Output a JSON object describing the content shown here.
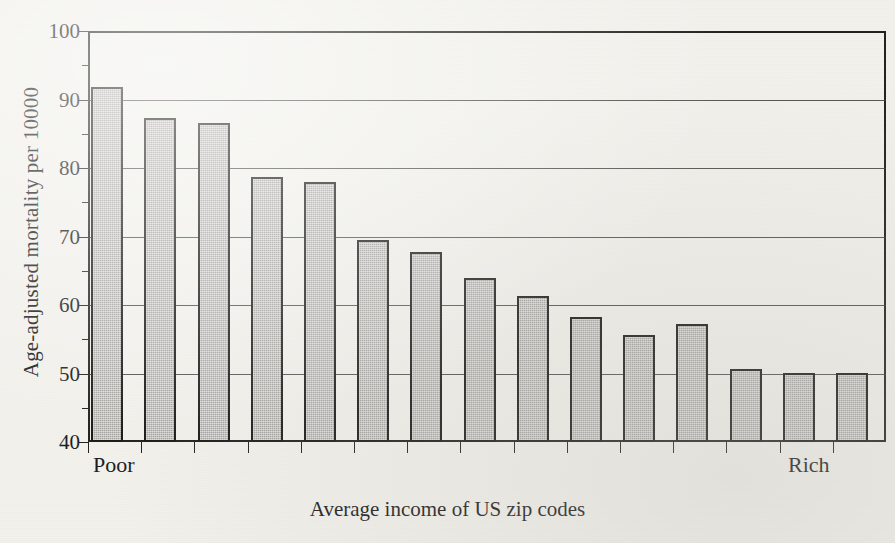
{
  "chart_data": {
    "type": "bar",
    "title": "",
    "subtitle": "",
    "xlabel": "Average income of US zip codes",
    "ylabel": "Age-adjusted mortality per 10000",
    "ylim": [
      40,
      100
    ],
    "yticks": [
      100,
      90,
      80,
      70,
      60,
      50,
      40
    ],
    "ytick_labels": [
      "100",
      "90",
      "80",
      "70",
      "60",
      "50",
      "40"
    ],
    "grid": true,
    "legend": false,
    "legend_position": "none",
    "x_axis_endpoints": {
      "left": "Poor",
      "right": "Rich"
    },
    "categories": [
      "1",
      "2",
      "3",
      "4",
      "5",
      "6",
      "7",
      "8",
      "9",
      "10",
      "11",
      "12",
      "13",
      "14",
      "15"
    ],
    "values": [
      91.8,
      87.3,
      86.5,
      78.7,
      78.0,
      69.5,
      67.7,
      64.0,
      61.3,
      58.2,
      55.6,
      57.2,
      50.7,
      50.1,
      50.1
    ],
    "bar_fill_color": "#a6a5a2",
    "bar_edge_color": "#1d1b19",
    "background_color": "#f2f1ec",
    "axis_color": "#23211f"
  },
  "axis": {
    "y_title": "Age-adjusted mortality per 10000",
    "x_title": "Average income of US zip codes",
    "poor_label": "Poor",
    "rich_label": "Rich"
  }
}
